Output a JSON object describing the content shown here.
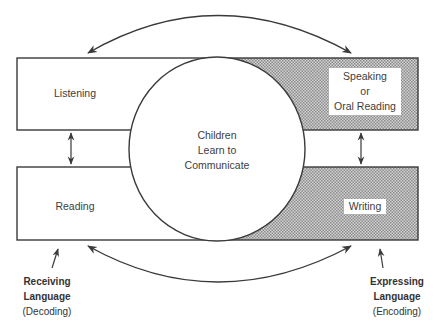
{
  "diagram": {
    "center": {
      "lines": [
        "Children",
        "Learn to",
        "Communicate"
      ]
    },
    "boxes": {
      "listening": {
        "label": "Listening",
        "shaded": false
      },
      "speaking": {
        "lines": [
          "Speaking",
          "or",
          "Oral Reading"
        ],
        "shaded": true
      },
      "reading": {
        "label": "Reading",
        "shaded": false
      },
      "writing": {
        "label": "Writing",
        "shaded": true
      }
    },
    "captions": {
      "receiving": {
        "line1": "Receiving",
        "line2": "Language",
        "line3": "(Decoding)"
      },
      "expressing": {
        "line1": "Expressing",
        "line2": "Language",
        "line3": "(Encoding)"
      }
    },
    "colors": {
      "line": "#3a3a3a",
      "shade_dot": "#9a9a9a",
      "background": "#ffffff"
    }
  }
}
